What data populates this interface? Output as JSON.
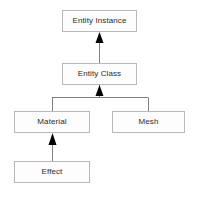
{
  "diagram": {
    "type": "uml-class-inheritance",
    "title": "",
    "background_color": "#ffffff",
    "box_fill_color": "#fdfdfd",
    "box_border_color": "#b8b8b8",
    "text_color": "#2b2b2b",
    "connector_color": "#808080",
    "arrowhead_color": "#000000",
    "nodes": [
      {
        "id": "entity-instance",
        "label": "Entity Instance",
        "x": 62,
        "y": 10,
        "width": 75,
        "height": 22
      },
      {
        "id": "entity-class",
        "label": "Entity Class",
        "x": 62,
        "y": 63,
        "width": 75,
        "height": 22
      },
      {
        "id": "material",
        "label": "Material",
        "x": 14,
        "y": 111,
        "width": 76,
        "height": 22
      },
      {
        "id": "mesh",
        "label": "Mesh",
        "x": 112,
        "y": 111,
        "width": 73,
        "height": 22
      },
      {
        "id": "effect",
        "label": "Effect",
        "x": 14,
        "y": 161,
        "width": 76,
        "height": 22
      }
    ],
    "edges": [
      {
        "id": "edge-entity-class-to-entity-instance",
        "from": "entity-class",
        "to": "entity-instance",
        "arrow": "filled-triangle",
        "direction": "up"
      },
      {
        "id": "edge-material-to-entity-class",
        "from": "material",
        "to": "entity-class",
        "arrow": "filled-triangle",
        "direction": "up",
        "routing": "orthogonal-shared-bus"
      },
      {
        "id": "edge-mesh-to-entity-class",
        "from": "mesh",
        "to": "entity-class",
        "arrow": "filled-triangle",
        "direction": "up",
        "routing": "orthogonal-shared-bus"
      },
      {
        "id": "edge-effect-to-material",
        "from": "effect",
        "to": "material",
        "arrow": "filled-triangle",
        "direction": "up"
      }
    ]
  }
}
